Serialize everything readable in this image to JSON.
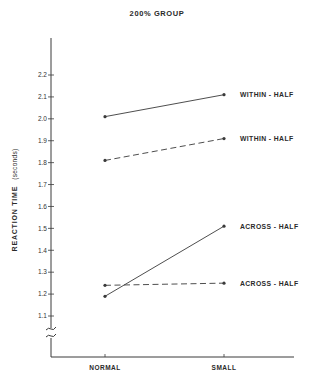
{
  "chart_data": {
    "type": "line",
    "title": "200% GROUP",
    "xlabel": "",
    "ylabel": "REACTION TIME",
    "ylabel_unit": "(seconds)",
    "categories": [
      "NORMAL",
      "SMALL"
    ],
    "ylim": [
      1.0,
      2.3
    ],
    "yticks": [
      "1.1",
      "1.2",
      "1.3",
      "1.4",
      "1.5",
      "1.6",
      "1.7",
      "1.8",
      "1.9",
      "2.0",
      "2.1",
      "2.2"
    ],
    "axis_break": true,
    "grid": false,
    "legend_position": "inline-right",
    "series": [
      {
        "name": "WITHIN - HALF",
        "line_style": "solid",
        "values": [
          2.01,
          2.11
        ]
      },
      {
        "name": "WITHIN - HALF",
        "line_style": "dashed",
        "values": [
          1.81,
          1.91
        ]
      },
      {
        "name": "ACROSS - HALF",
        "line_style": "solid",
        "values": [
          1.19,
          1.51
        ]
      },
      {
        "name": "ACROSS - HALF",
        "line_style": "dashed",
        "values": [
          1.24,
          1.25
        ]
      }
    ]
  },
  "colors": {
    "line": "#3a3a3a",
    "text": "#2a2a2a",
    "background": "#ffffff"
  }
}
